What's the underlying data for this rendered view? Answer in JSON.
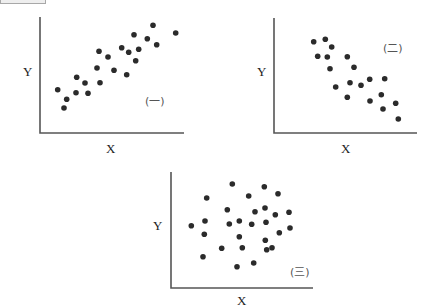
{
  "chart_data": [
    {
      "type": "scatter",
      "title": "",
      "panel_label": "(一)",
      "xlabel": "X",
      "ylabel": "Y",
      "grid": false,
      "legend": "none",
      "correlation": "positive",
      "points_px": [
        [
          57.7,
          89.7
        ],
        [
          66.7,
          99.3
        ],
        [
          64,
          108
        ],
        [
          76.7,
          77.3
        ],
        [
          76,
          92.7
        ],
        [
          85,
          83
        ],
        [
          88,
          93.3
        ],
        [
          99,
          51.3
        ],
        [
          97,
          68
        ],
        [
          100,
          82.7
        ],
        [
          108,
          57
        ],
        [
          114,
          70.3
        ],
        [
          121.7,
          47.7
        ],
        [
          128.7,
          52.3
        ],
        [
          134,
          34.7
        ],
        [
          138.7,
          49.3
        ],
        [
          135.7,
          60.7
        ],
        [
          126.7,
          74.7
        ],
        [
          147.3,
          38.7
        ],
        [
          153,
          25.3
        ],
        [
          156.7,
          44.7
        ],
        [
          175.7,
          33
        ]
      ],
      "axes": {
        "origin": [
          40,
          133
        ],
        "x_end": 184,
        "y_top": 17
      }
    },
    {
      "type": "scatter",
      "title": "",
      "panel_label": "(二)",
      "xlabel": "X",
      "ylabel": "Y",
      "grid": false,
      "legend": "none",
      "correlation": "negative",
      "points_px": [
        [
          313.7,
          41.7
        ],
        [
          325.3,
          39.3
        ],
        [
          331.7,
          47
        ],
        [
          317.7,
          56.3
        ],
        [
          327.3,
          57
        ],
        [
          330,
          68.7
        ],
        [
          347.3,
          56.7
        ],
        [
          354,
          67.3
        ],
        [
          335.7,
          87
        ],
        [
          350,
          82.7
        ],
        [
          361,
          85.3
        ],
        [
          369.7,
          79.3
        ],
        [
          384.7,
          78.7
        ],
        [
          347.3,
          97.3
        ],
        [
          370,
          101
        ],
        [
          381.3,
          94.7
        ],
        [
          383,
          109
        ],
        [
          395.7,
          103.3
        ],
        [
          398.3,
          119
        ]
      ],
      "axes": {
        "origin": [
          274,
          133
        ],
        "x_end": 417,
        "y_top": 18
      }
    },
    {
      "type": "scatter",
      "title": "",
      "panel_label": "(三)",
      "xlabel": "X",
      "ylabel": "Y",
      "grid": false,
      "legend": "none",
      "correlation": "none",
      "points_px": [
        [
          232.3,
          184
        ],
        [
          264.3,
          186.7
        ],
        [
          278,
          193.7
        ],
        [
          248.7,
          196
        ],
        [
          206.7,
          198
        ],
        [
          227.3,
          209.7
        ],
        [
          265,
          208
        ],
        [
          255,
          211.7
        ],
        [
          275.3,
          214.7
        ],
        [
          289,
          212.3
        ],
        [
          205,
          221
        ],
        [
          191.3,
          225.7
        ],
        [
          229.3,
          224
        ],
        [
          239.3,
          221
        ],
        [
          251.7,
          224.3
        ],
        [
          266,
          222.3
        ],
        [
          290,
          228
        ],
        [
          204.3,
          234.3
        ],
        [
          239.3,
          236.7
        ],
        [
          279.3,
          232.7
        ],
        [
          265.3,
          240.3
        ],
        [
          221.7,
          248.3
        ],
        [
          242.3,
          247.7
        ],
        [
          266.7,
          249.7
        ],
        [
          272,
          247.7
        ],
        [
          203,
          256.7
        ],
        [
          253.7,
          263
        ],
        [
          237,
          266.7
        ]
      ],
      "axes": {
        "origin": [
          171,
          288
        ],
        "x_end": 313,
        "y_top": 172
      }
    }
  ],
  "labels": {
    "p1": {
      "y": "Y",
      "x": "X",
      "tag": "(一)"
    },
    "p2": {
      "y": "Y",
      "x": "X",
      "tag": "(二)"
    },
    "p3": {
      "y": "Y",
      "x": "X",
      "tag": "(三)"
    }
  },
  "colors": {
    "point": "#2b2b2b",
    "axis": "#555555"
  }
}
